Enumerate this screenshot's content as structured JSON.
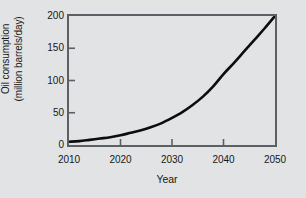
{
  "chart_data": {
    "type": "line",
    "title": "",
    "xlabel": "Year",
    "ylabel": "Oil consumption (million barrels/day)",
    "ylabel_line1": "Oil consumption",
    "ylabel_line2": "(million barrels/day)",
    "xlim": [
      2010,
      2050
    ],
    "ylim": [
      0,
      200
    ],
    "xticks": [
      2010,
      2020,
      2030,
      2040,
      2050
    ],
    "xtick_labels": [
      "2010",
      "2020",
      "2030",
      "2040",
      "2050"
    ],
    "yticks": [
      0,
      50,
      100,
      150,
      200
    ],
    "ytick_labels": [
      "0",
      "50",
      "100",
      "150",
      "200"
    ],
    "grid": false,
    "legend": null,
    "series": [
      {
        "name": "Oil consumption",
        "color": "#0d0d0f",
        "x": [
          2010,
          2012,
          2014,
          2016,
          2018,
          2020,
          2022,
          2024,
          2026,
          2028,
          2030,
          2032,
          2034,
          2036,
          2038,
          2040,
          2042,
          2044,
          2046,
          2048,
          2050
        ],
        "y": [
          5,
          6,
          8,
          10,
          12,
          15,
          19,
          23,
          28,
          34,
          42,
          51,
          62,
          75,
          91,
          110,
          127,
          145,
          163,
          181,
          200
        ]
      }
    ]
  },
  "axis_color": "#5c6066",
  "background_color": "#e2e3e5",
  "text_color": "#17181a"
}
